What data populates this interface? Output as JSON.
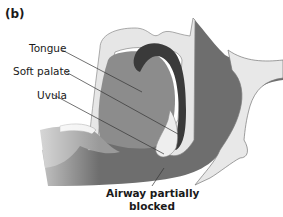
{
  "figure": {
    "panel_label": "(b)",
    "labels": {
      "tongue": "Tongue",
      "soft_palate": "Soft palate",
      "uvula": "Uvula",
      "airway_line1": "Airway partially",
      "airway_line2": "blocked"
    },
    "colors": {
      "dark_tissue": "#6e6e6e",
      "mid_tissue": "#8c8c8c",
      "light_tissue": "#e6e6e6",
      "airway_dark": "#3a3a3a",
      "leader_line": "#333333"
    }
  }
}
